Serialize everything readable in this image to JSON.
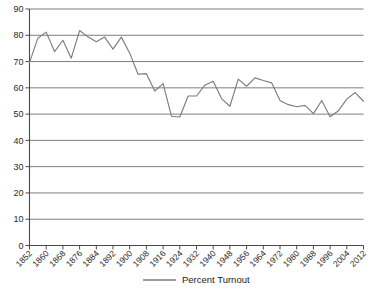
{
  "chart_data": {
    "type": "line",
    "title": "",
    "subtitle": "",
    "xlabel": "",
    "ylabel": "",
    "ylim": [
      0,
      90
    ],
    "ytick_step": 10,
    "yticks": [
      0,
      10,
      20,
      30,
      40,
      50,
      60,
      70,
      80,
      90
    ],
    "ytick_labels": [
      "0",
      "10",
      "20",
      "30",
      "40",
      "50",
      "60",
      "70",
      "80",
      "90"
    ],
    "xlim": [
      1852,
      2012
    ],
    "xtick_step": 8,
    "xticks": [
      1852,
      1860,
      1868,
      1876,
      1884,
      1892,
      1900,
      1908,
      1916,
      1924,
      1932,
      1940,
      1948,
      1956,
      1964,
      1972,
      1980,
      1988,
      1996,
      2004,
      2012
    ],
    "xtick_labels": [
      "1852",
      "1860",
      "1868",
      "1876",
      "1884",
      "1892",
      "1900",
      "1908",
      "1916",
      "1924",
      "1932",
      "1940",
      "1948",
      "1956",
      "1964",
      "1972",
      "1980",
      "1988",
      "1996",
      "2004",
      "2012"
    ],
    "xtick_rotation": -45,
    "grid": "horizontal",
    "legend_position": "bottom-center",
    "legend": [
      "Percent Turnout"
    ],
    "series": [
      {
        "name": "Percent Turnout",
        "color": "#7d7d7d",
        "x": [
          1852,
          1856,
          1860,
          1864,
          1868,
          1872,
          1876,
          1880,
          1884,
          1888,
          1892,
          1896,
          1900,
          1904,
          1908,
          1912,
          1916,
          1920,
          1924,
          1928,
          1932,
          1936,
          1940,
          1944,
          1948,
          1952,
          1956,
          1960,
          1964,
          1968,
          1972,
          1976,
          1980,
          1984,
          1988,
          1992,
          1996,
          2000,
          2004,
          2008,
          2012
        ],
        "values": [
          69.6,
          78.9,
          81.2,
          73.8,
          78.1,
          71.3,
          81.8,
          79.4,
          77.5,
          79.3,
          74.7,
          79.3,
          73.2,
          65.2,
          65.4,
          58.8,
          61.6,
          49.2,
          48.9,
          56.9,
          56.9,
          61.0,
          62.5,
          55.9,
          53.0,
          63.3,
          60.6,
          63.8,
          62.8,
          61.9,
          55.2,
          53.6,
          52.8,
          53.3,
          50.2,
          55.2,
          49.0,
          51.3,
          55.7,
          58.2,
          54.9
        ]
      }
    ]
  },
  "legend": {
    "entries": [
      {
        "label": "Percent Turnout",
        "color": "#7d7d7d"
      }
    ]
  },
  "colors": {
    "series": "#7d7d7d",
    "grid": "#6f6f6f",
    "axis": "#4a4a4a",
    "text": "#2a2a2a",
    "background": "#ffffff"
  }
}
